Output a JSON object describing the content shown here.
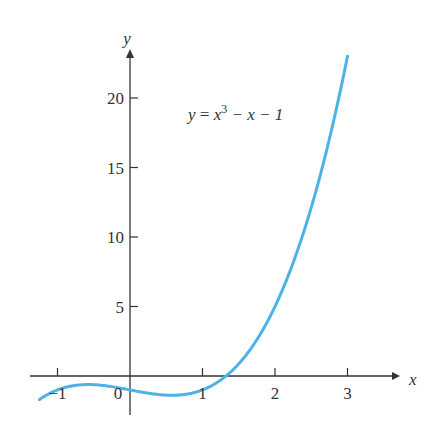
{
  "chart_data": {
    "type": "line",
    "title": "",
    "xlabel": "x",
    "ylabel": "y",
    "annotation": {
      "y_part": "y",
      "eq_sign": "=",
      "x_base": "x",
      "exponent": "3",
      "rest": " − x − 1",
      "full_text": "y = x^3 − x − 1"
    },
    "x_ticks": [
      -1,
      1,
      2,
      3
    ],
    "x_tick_labels": [
      "−1",
      "1",
      "2",
      "3"
    ],
    "origin_label": "0",
    "y_ticks": [
      5,
      10,
      15,
      20
    ],
    "y_tick_labels": [
      "5",
      "10",
      "15",
      "20"
    ],
    "xlim": [
      -1.3,
      3.6
    ],
    "ylim": [
      -2,
      24
    ],
    "grid": false,
    "legend": null,
    "series": [
      {
        "name": "y = x^3 - x - 1",
        "color": "#4db3e6",
        "x": [
          -1.25,
          -1.0,
          -0.75,
          -0.577,
          -0.5,
          -0.25,
          0,
          0.25,
          0.5,
          0.577,
          0.75,
          1.0,
          1.25,
          1.5,
          1.75,
          2.0,
          2.25,
          2.5,
          2.75,
          3.0
        ],
        "y": [
          -0.703,
          -1.0,
          -0.672,
          -0.615,
          -0.625,
          -0.766,
          -1.0,
          -1.234,
          -1.375,
          -1.385,
          -1.328,
          -1.0,
          0.203,
          0.875,
          2.609,
          5.0,
          8.141,
          12.125,
          17.047,
          23.0
        ]
      }
    ]
  },
  "colors": {
    "axis": "#333333",
    "curve": "#4db3e6"
  }
}
